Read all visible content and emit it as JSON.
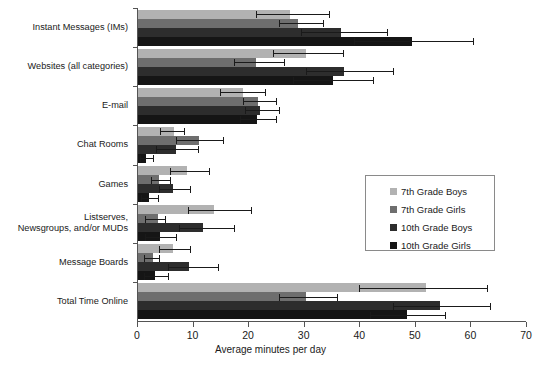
{
  "chart_data": {
    "type": "bar",
    "orientation": "horizontal",
    "title": "",
    "xlabel": "Average minutes per day",
    "ylabel": "",
    "xlim": [
      0,
      70
    ],
    "xticks": [
      0,
      10,
      20,
      30,
      40,
      50,
      60,
      70
    ],
    "grid": false,
    "legend_position": "center-right",
    "categories": [
      "Instant Messages (IMs)",
      "Websites (all categories)",
      "E-mail",
      "Chat Rooms",
      "Games",
      "Listserves,\nNewsgroups, and/or MUDs",
      "Message Boards",
      "Total Time Online"
    ],
    "series": [
      {
        "name": "7th Grade Boys",
        "color": "#b2b2b2",
        "values": [
          27.5,
          30.5,
          19.0,
          6.6,
          9.0,
          13.9,
          6.4,
          52.0
        ],
        "err_low": [
          21.5,
          24.5,
          15.0,
          4.2,
          6.0,
          9.2,
          4.0,
          40.0
        ],
        "err_high": [
          34.5,
          37.0,
          23.0,
          8.5,
          13.0,
          20.5,
          9.5,
          63.0
        ]
      },
      {
        "name": "7th Grade Girls",
        "color": "#6e6e6e",
        "values": [
          29.0,
          21.5,
          21.8,
          11.2,
          4.0,
          3.7,
          2.8,
          30.5
        ],
        "err_low": [
          25.5,
          17.5,
          19.0,
          7.0,
          2.5,
          1.5,
          1.2,
          25.5
        ],
        "err_high": [
          33.5,
          26.5,
          25.0,
          15.5,
          6.0,
          5.0,
          4.0,
          36.0
        ]
      },
      {
        "name": "10th Grade Boys",
        "color": "#2d2d2d",
        "values": [
          36.8,
          37.2,
          22.2,
          7.0,
          6.5,
          11.8,
          9.3,
          54.5
        ],
        "err_low": [
          29.5,
          30.5,
          19.5,
          3.5,
          4.0,
          7.5,
          5.5,
          46.0
        ],
        "err_high": [
          45.0,
          46.0,
          25.5,
          11.0,
          9.5,
          17.5,
          14.5,
          63.5
        ]
      },
      {
        "name": "10th Grade Girls",
        "color": "#151515",
        "values": [
          49.5,
          35.2,
          21.6,
          1.6,
          2.2,
          4.2,
          3.2,
          48.5
        ],
        "err_low": [
          39.0,
          28.0,
          18.5,
          0.6,
          0.8,
          1.5,
          1.2,
          42.0
        ],
        "err_high": [
          60.5,
          42.5,
          25.0,
          2.8,
          3.8,
          7.0,
          5.5,
          55.5
        ]
      }
    ]
  },
  "legend": {
    "items": [
      {
        "label": "7th Grade Boys",
        "color": "#b2b2b2"
      },
      {
        "label": "7th Grade Girls",
        "color": "#6e6e6e"
      },
      {
        "label": "10th Grade Boys",
        "color": "#2d2d2d"
      },
      {
        "label": "10th Grade Girls",
        "color": "#151515"
      }
    ]
  }
}
